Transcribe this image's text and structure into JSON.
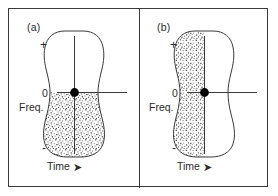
{
  "figure": {
    "type": "diagram",
    "background_color": "#ffffff",
    "frame_color": "#3a3a3a",
    "ink_color": "#2b2b2b",
    "stipple_color": "#4a4a4a",
    "marker_color": "#000000",
    "panels": [
      {
        "id": "a",
        "label": "(a)",
        "axes": {
          "y_top_label": "+",
          "y_zero_label": "0",
          "y_bottom_label": "-",
          "y_axis_name": "Freq.",
          "x_axis_name": "Time",
          "x_axis_arrow": "➤"
        },
        "shaded_region": "lower-half",
        "shaded_description": "stippling fills the region below the zero-frequency axis",
        "center_marker": "filled-dot-at-origin"
      },
      {
        "id": "b",
        "label": "(b)",
        "axes": {
          "y_top_label": "+",
          "y_zero_label": "0",
          "y_bottom_label": "-",
          "y_axis_name": "Freq.",
          "x_axis_name": "Time",
          "x_axis_arrow": "➤"
        },
        "shaded_region": "left-half",
        "shaded_description": "stippling fills the region left of the vertical center-time line",
        "center_marker": "filled-dot-at-origin"
      }
    ]
  }
}
